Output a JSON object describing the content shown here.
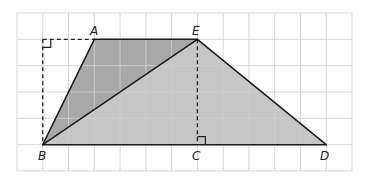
{
  "diagram": {
    "grid": {
      "cols": 13,
      "rows": 6,
      "x0": 17,
      "y0": 13,
      "cell_w": 25.77,
      "cell_h": 26.33,
      "line_color": "#cfcfcf"
    },
    "points": {
      "A": {
        "label": "A",
        "col": 3,
        "row": 1
      },
      "E": {
        "label": "E",
        "col": 7,
        "row": 1
      },
      "B": {
        "label": "B",
        "col": 1,
        "row": 5
      },
      "C": {
        "label": "C",
        "col": 7,
        "row": 5
      },
      "D": {
        "label": "D",
        "col": 12,
        "row": 5
      },
      "F": {
        "label": "",
        "col": 1,
        "row": 1
      }
    },
    "regions": [
      {
        "name": "triangle-ABE",
        "vertices": [
          "A",
          "E",
          "B"
        ],
        "fill": "#a8a8a8"
      },
      {
        "name": "triangle-BED",
        "vertices": [
          "B",
          "E",
          "D"
        ],
        "fill": "#c6c6c6"
      }
    ],
    "solid_segments": [
      [
        "A",
        "E"
      ],
      [
        "E",
        "D"
      ],
      [
        "D",
        "B"
      ],
      [
        "B",
        "A"
      ],
      [
        "B",
        "E"
      ]
    ],
    "dashed_segments": [
      [
        "F",
        "A"
      ],
      [
        "F",
        "B"
      ],
      [
        "E",
        "C"
      ]
    ],
    "right_angles": [
      "F",
      "C"
    ],
    "labels": {
      "A": "A",
      "B": "B",
      "C": "C",
      "D": "D",
      "E": "E"
    }
  }
}
